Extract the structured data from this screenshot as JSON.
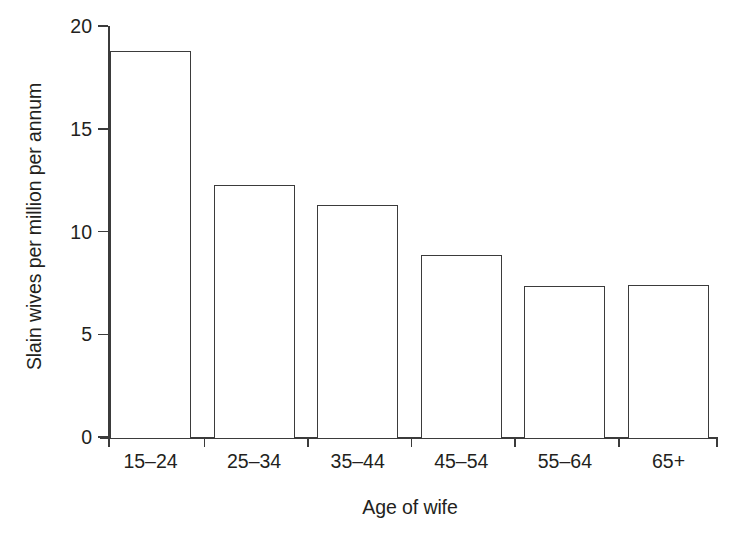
{
  "chart_data": {
    "type": "bar",
    "title": "",
    "subtitle": "",
    "xlabel": "Age of wife",
    "ylabel": "Slain wives per million per annum",
    "categories": [
      "15–24",
      "25–34",
      "35–44",
      "45–54",
      "55–64",
      "65+"
    ],
    "values": [
      18.8,
      12.25,
      11.3,
      8.85,
      7.35,
      7.4
    ],
    "ylim": [
      0,
      20
    ],
    "yticks": [
      0,
      5,
      10,
      15,
      20
    ],
    "ytick_labels": [
      "0",
      "5",
      "10",
      "15",
      "20"
    ],
    "grid": false,
    "legend": null,
    "legend_position": "none",
    "annotations": [],
    "series": [
      {
        "name": "Slain wives per million per annum",
        "values": [
          18.8,
          12.25,
          11.3,
          8.85,
          7.35,
          7.4
        ]
      }
    ],
    "style": {
      "bar_face_color": "#ffffff",
      "bar_edge_color": "#3b3b3b",
      "axis_color": "#3b3b3b",
      "text_color": "#231f20",
      "background": "#ffffff"
    }
  },
  "axes": {
    "y_title": "Slain wives per million per annum",
    "x_title": "Age of wife"
  }
}
